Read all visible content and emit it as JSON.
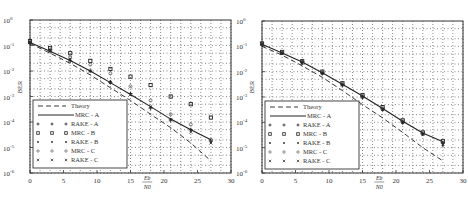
{
  "chart_data": [
    {
      "type": "line",
      "title": "",
      "xlabel": "Eb/N0",
      "ylabel": "BER",
      "xlim": [
        0,
        30
      ],
      "ylim": [
        1e-06,
        1
      ],
      "yscale": "log",
      "grid": true,
      "legend_position": "lower left",
      "xticks": [
        "0",
        "5",
        "10",
        "15",
        "20",
        "25",
        "30"
      ],
      "yticks": [
        "10^-6",
        "10^-5",
        "10^-4",
        "10^-3",
        "10^-2",
        "10^-1",
        "10^0"
      ],
      "x": [
        0,
        3,
        6,
        9,
        12,
        15,
        18,
        21,
        24,
        27
      ],
      "series": [
        {
          "name": "Theory",
          "style": "dashed",
          "values": [
            0.12,
            0.05,
            0.02,
            0.007,
            0.0022,
            0.0007,
            0.0002,
            6e-05,
            1.5e-05,
            3e-06
          ]
        },
        {
          "name": "MRC - A",
          "style": "solid",
          "values": [
            0.13,
            0.06,
            0.026,
            0.01,
            0.0035,
            0.0012,
            0.0004,
            0.00013,
            5e-05,
            2e-05
          ]
        },
        {
          "name": "RAKE - A",
          "style": "marker-plus",
          "values": [
            0.12,
            0.06,
            0.025,
            0.01,
            0.0035,
            0.0013,
            0.00035,
            0.00012,
            5e-05,
            1.8e-05
          ]
        },
        {
          "name": "MRC - B",
          "style": "marker-square",
          "values": [
            0.15,
            0.08,
            0.05,
            0.025,
            0.012,
            0.006,
            0.0028,
            0.001,
            0.0005,
            0.00015
          ]
        },
        {
          "name": "RAKE - B",
          "style": "marker-dot",
          "values": [
            0.14,
            0.07,
            0.03,
            0.01,
            0.004,
            0.0013,
            0.0004,
            0.00013,
            5e-05,
            1.6e-05
          ]
        },
        {
          "name": "MRC - C",
          "style": "marker-circle",
          "values": [
            0.13,
            0.065,
            0.035,
            0.018,
            0.008,
            0.0025,
            0.0007,
            0.0002,
            8e-05,
            2e-05
          ]
        },
        {
          "name": "RAKE - C",
          "style": "marker-x",
          "values": [
            0.13,
            0.06,
            0.027,
            0.01,
            0.0035,
            0.0012,
            0.0004,
            0.00012,
            4e-05,
            1.5e-05
          ]
        }
      ]
    },
    {
      "type": "line",
      "title": "",
      "xlabel": "Eb/N0",
      "ylabel": "BER",
      "xlim": [
        0,
        30
      ],
      "ylim": [
        1e-06,
        1
      ],
      "yscale": "log",
      "grid": true,
      "legend_position": "lower left",
      "xticks": [
        "0",
        "5",
        "10",
        "15",
        "20",
        "25",
        "30"
      ],
      "yticks": [
        "10^-6",
        "10^-5",
        "10^-4",
        "10^-3",
        "10^-2",
        "10^-1",
        "10^0"
      ],
      "x": [
        0,
        3,
        6,
        9,
        12,
        15,
        18,
        21,
        24,
        27
      ],
      "series": [
        {
          "name": "Theory",
          "style": "dashed",
          "values": [
            0.1,
            0.045,
            0.017,
            0.006,
            0.0018,
            0.0005,
            0.00015,
            4e-05,
            1e-05,
            3e-06
          ]
        },
        {
          "name": "MRC - A",
          "style": "solid",
          "values": [
            0.12,
            0.055,
            0.024,
            0.009,
            0.0032,
            0.0011,
            0.00035,
            0.00011,
            3.8e-05,
            1.7e-05
          ]
        },
        {
          "name": "RAKE - A",
          "style": "marker-plus",
          "values": [
            0.12,
            0.055,
            0.024,
            0.009,
            0.003,
            0.001,
            0.00033,
            0.0001,
            3.5e-05,
            1.5e-05
          ]
        },
        {
          "name": "MRC - B",
          "style": "marker-square",
          "values": [
            0.13,
            0.06,
            0.026,
            0.01,
            0.0035,
            0.0012,
            0.0004,
            0.00012,
            4e-05,
            1.8e-05
          ]
        },
        {
          "name": "RAKE - B",
          "style": "marker-dot",
          "values": [
            0.11,
            0.05,
            0.02,
            0.008,
            0.0028,
            0.0009,
            0.0003,
            9e-05,
            3.2e-05,
            1.2e-05
          ]
        },
        {
          "name": "MRC - C",
          "style": "marker-circle",
          "values": [
            0.12,
            0.056,
            0.025,
            0.0095,
            0.0033,
            0.0011,
            0.00036,
            0.00011,
            3.7e-05,
            1.6e-05
          ]
        },
        {
          "name": "RAKE - C",
          "style": "marker-x",
          "values": [
            0.12,
            0.052,
            0.022,
            0.0085,
            0.003,
            0.001,
            0.00032,
            0.0001,
            3.4e-05,
            1.4e-05
          ]
        }
      ]
    }
  ],
  "plots": [
    {
      "ylabel": "BER",
      "xlabel_top": "Eb",
      "xlabel_bottom": "N0",
      "ytick_labels": [
        "10",
        "10",
        "10",
        "10",
        "10",
        "10",
        "10"
      ],
      "ytick_exps": [
        "0",
        "-1",
        "-2",
        "-3",
        "-4",
        "-5",
        "-6"
      ],
      "xtick_labels": [
        "0",
        "5",
        "10",
        "15",
        "20",
        "25",
        "30"
      ],
      "legend": [
        {
          "label": "Theory",
          "marker": "- - -"
        },
        {
          "label": "MRC - A",
          "marker": "———"
        },
        {
          "label": "RAKE - A",
          "marker": "+ + +"
        },
        {
          "label": "MRC - B",
          "marker": "□ □ □"
        },
        {
          "label": "RAKE - B",
          "marker": "• • •"
        },
        {
          "label": "MRC - C",
          "marker": "○ ○ ○"
        },
        {
          "label": "RAKE - C",
          "marker": "× × ×"
        }
      ]
    },
    {
      "ylabel": "BER",
      "xlabel_top": "Eb",
      "xlabel_bottom": "N0",
      "ytick_labels": [
        "10",
        "10",
        "10",
        "10",
        "10",
        "10",
        "10"
      ],
      "ytick_exps": [
        "0",
        "-1",
        "-2",
        "-3",
        "-4",
        "-5",
        "-6"
      ],
      "xtick_labels": [
        "0",
        "5",
        "10",
        "15",
        "20",
        "25",
        "30"
      ],
      "legend": [
        {
          "label": "Theory",
          "marker": "- - -"
        },
        {
          "label": "MRC - A",
          "marker": "———"
        },
        {
          "label": "RAKE - A",
          "marker": "+ + +"
        },
        {
          "label": "MRC - B",
          "marker": "□ □ □"
        },
        {
          "label": "RAKE - B",
          "marker": "• • •"
        },
        {
          "label": "MRC - C",
          "marker": "○ ○ ○"
        },
        {
          "label": "RAKE - C",
          "marker": "× × ×"
        }
      ]
    }
  ]
}
